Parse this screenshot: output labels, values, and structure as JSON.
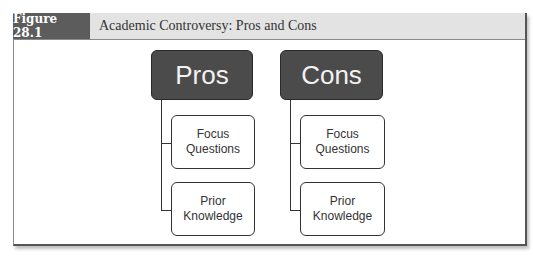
{
  "figure": {
    "label": "Figure 28.1",
    "title": "Academic Controversy: Pros and Cons"
  },
  "diagram": {
    "columns": [
      {
        "heading": "Pros",
        "children": [
          "Focus\nQuestions",
          "Prior\nKnowledge"
        ]
      },
      {
        "heading": "Cons",
        "children": [
          "Focus\nQuestions",
          "Prior\nKnowledge"
        ]
      }
    ]
  },
  "colors": {
    "header_label_bg": "#5c5c5c",
    "header_bar_bg": "#e3e3e3",
    "main_node_bg": "#4b4b4b",
    "child_node_border": "#333333"
  }
}
